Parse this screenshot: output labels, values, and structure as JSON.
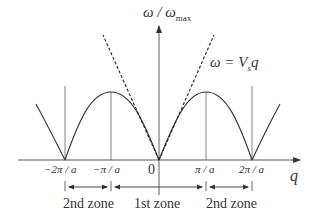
{
  "diagram": {
    "y_axis_label": "ω / ω",
    "y_axis_sub": "max",
    "x_axis_label": "q",
    "linear_label_lhs": "ω",
    "linear_label_rhs": "= V",
    "linear_label_sub": "s",
    "linear_label_tail": "q",
    "ticks": {
      "neg2": "−2π / a",
      "neg1": "−π / a",
      "zero": "0",
      "pos1": "π / a",
      "pos2": "2π / a"
    },
    "zones": {
      "left": "2nd zone",
      "center": "1st zone",
      "right": "2nd zone"
    },
    "colors": {
      "curve": "#333333",
      "axis": "#555555",
      "text": "#333333"
    }
  }
}
